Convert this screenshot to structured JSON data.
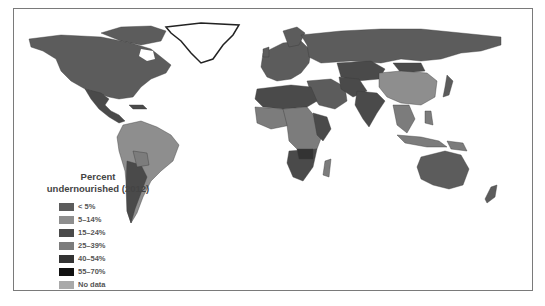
{
  "map": {
    "title": "Percent undernourished (2012)",
    "title_line1": "Percent",
    "title_line2": "undernourished (2012)",
    "legend": [
      {
        "label": "< 5%",
        "color": "#5c5c5c"
      },
      {
        "label": "5–14%",
        "color": "#8e8e8e"
      },
      {
        "label": "15–24%",
        "color": "#4a4a4a"
      },
      {
        "label": "25–39%",
        "color": "#7c7c7c"
      },
      {
        "label": "40–54%",
        "color": "#333333"
      },
      {
        "label": "55–70%",
        "color": "#111111"
      },
      {
        "label": "No data",
        "color": "#a9a9a9"
      }
    ],
    "colors": {
      "lt5": "#5c5c5c",
      "p5_14": "#8e8e8e",
      "p15_24": "#4a4a4a",
      "p25_39": "#7c7c7c",
      "p40_54": "#333333",
      "p55_70": "#111111",
      "nodata": "#a9a9a9",
      "frame": "#7a7a7a"
    }
  }
}
